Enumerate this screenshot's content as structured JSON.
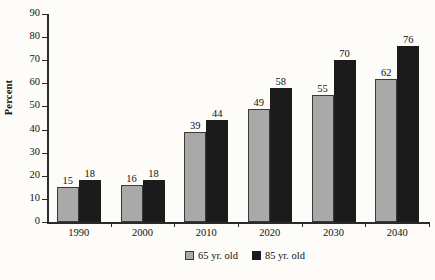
{
  "chart_data": {
    "type": "bar",
    "title": "",
    "xlabel": "",
    "ylabel": "Percent",
    "ylim": [
      0,
      90
    ],
    "ytick_step": 10,
    "yticks": [
      0,
      10,
      20,
      30,
      40,
      50,
      60,
      70,
      80,
      90
    ],
    "grid": false,
    "legend_position": "bottom-center",
    "categories": [
      "1990",
      "2000",
      "2010",
      "2020",
      "2030",
      "2040"
    ],
    "series": [
      {
        "name": "65 yr. old",
        "color": "#a9a9a9",
        "values": [
          15,
          16,
          39,
          49,
          55,
          62
        ]
      },
      {
        "name": "85 yr. old",
        "color": "#1b1b1b",
        "values": [
          18,
          18,
          44,
          58,
          70,
          76
        ]
      }
    ]
  },
  "legend": {
    "items": [
      {
        "label": "65 yr. old",
        "swatch": "gray-swatch"
      },
      {
        "label": "85 yr. old",
        "swatch": "black-swatch"
      }
    ]
  },
  "source_note": {
    "text": ""
  }
}
